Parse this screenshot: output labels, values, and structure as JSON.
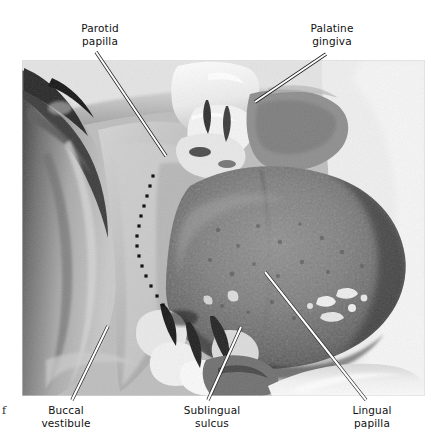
{
  "figure": {
    "type": "clinical-photograph",
    "rendering": "grayscale halftone photograph",
    "caption_fragment": "f"
  },
  "photo": {
    "x": 22,
    "y": 60,
    "width": 403,
    "height": 336,
    "palette": {
      "darkest": "#1d1d1d",
      "dark": "#4a4a4a",
      "midtone": "#8e8e8e",
      "light": "#c8c8c8",
      "highlight": "#f2f2f2",
      "white": "#ffffff"
    }
  },
  "labels": [
    {
      "id": "parotid-papilla",
      "line1": "Parotid",
      "line2": "papilla",
      "text_x": 100,
      "text_y": 22,
      "leader": {
        "x1": 96,
        "y1": 52,
        "x2": 166,
        "y2": 156
      }
    },
    {
      "id": "palatine-gingiva",
      "line1": "Palatine",
      "line2": "gingiva",
      "text_x": 332,
      "text_y": 22,
      "leader": {
        "x1": 326,
        "y1": 54,
        "x2": 255,
        "y2": 102
      }
    },
    {
      "id": "buccal-vestibule",
      "line1": "Buccal",
      "line2": "vestibule",
      "text_x": 66,
      "text_y": 404,
      "leader": {
        "x1": 72,
        "y1": 400,
        "x2": 108,
        "y2": 326
      }
    },
    {
      "id": "sublingual-sulcus",
      "line1": "Sublingual",
      "line2": "sulcus",
      "text_x": 212,
      "text_y": 404,
      "leader": {
        "x1": 208,
        "y1": 400,
        "x2": 241,
        "y2": 327
      }
    },
    {
      "id": "lingual-papilla",
      "line1": "Lingual",
      "line2": "papilla",
      "text_x": 372,
      "text_y": 404,
      "leader": {
        "x1": 366,
        "y1": 400,
        "x2": 265,
        "y2": 272
      }
    }
  ],
  "dotted_marker": {
    "id": "buccal-boundary-dotted-line",
    "description": "dotted line marking mucogingival boundary",
    "dot_color": "#141414",
    "dot_size": 3.2,
    "points": [
      [
        153,
        176
      ],
      [
        150,
        186
      ],
      [
        147,
        196
      ],
      [
        144,
        206
      ],
      [
        141,
        216
      ],
      [
        139,
        226
      ],
      [
        137,
        236
      ],
      [
        137,
        246
      ],
      [
        139,
        256
      ],
      [
        142,
        266
      ],
      [
        146,
        276
      ],
      [
        151,
        286
      ],
      [
        157,
        296
      ],
      [
        163,
        305
      ]
    ]
  },
  "leader_style": {
    "core_color": "#ffffff",
    "edge_color": "#1a1a1a",
    "core_width": 2.1,
    "edge_width": 3.4
  }
}
